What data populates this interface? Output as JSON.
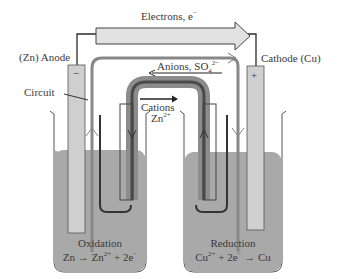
{
  "diagram": {
    "type": "galvanic-cell",
    "labels": {
      "electrons": "Electrons, e",
      "electrons_sup": "−",
      "anode": "(Zn) Anode",
      "cathode": "Cathode (Cu)",
      "circuit": "Circuit",
      "anions": "Anions, SO",
      "anions_sub": "4",
      "anions_sup": "2−",
      "cations": "Cations",
      "cations_ion": "Zn",
      "cations_ion_sup": "2+",
      "anode_sign": "−",
      "cathode_sign": "+",
      "oxidation_title": "Oxidation",
      "oxidation_eq_a": "Zn → Zn",
      "oxidation_eq_sup": "2+",
      "oxidation_eq_b": " + 2e",
      "oxidation_eq_sup2": "−",
      "reduction_title": "Reduction",
      "reduction_eq_a": "Cu",
      "reduction_eq_sup": "2+",
      "reduction_eq_b": " + 2e",
      "reduction_eq_sup2": "−",
      "reduction_eq_c": " → Cu"
    },
    "colors": {
      "solution": "#a9a9a9",
      "electrode": "#cfcfcf",
      "wire": "#2b2b2b",
      "arrow_fill": "#e2e2e2",
      "circuit_loop": "#888888",
      "salt_bridge_outer": "#8c8c8c",
      "salt_bridge_inner": "#555555"
    }
  }
}
